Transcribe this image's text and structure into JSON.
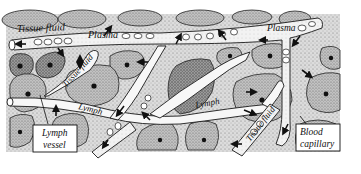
{
  "diagram": {
    "labels": {
      "tissue_fluid_top": "Tissue fluid",
      "plasma_left": "Plasma",
      "plasma_right": "Plasma",
      "tissue_fluid_mid": "Tissue fluid",
      "lymph_left": "Lymph",
      "lymph_center": "Lymph",
      "tissue_fluid_bottom": "Tissue fluid"
    },
    "callouts": {
      "lymph_vessel_line1": "Lymph",
      "lymph_vessel_line2": "vessel",
      "blood_capillary_line1": "Blood",
      "blood_capillary_line2": "capillary"
    },
    "colors": {
      "outline": "#1a1a1a",
      "cell_fill": "#bdbdbd",
      "cell_fill_dark": "#9a9a9a",
      "vessel_fill": "#f4f4f4",
      "tissue_bg": "#e4e4e4",
      "nucleus": "#111111"
    }
  }
}
